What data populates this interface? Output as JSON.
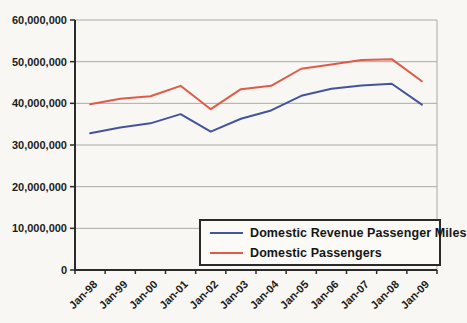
{
  "chart_data": {
    "type": "line",
    "title": "",
    "xlabel": "",
    "ylabel": "",
    "categories": [
      "Jan-98",
      "Jan-99",
      "Jan-00",
      "Jan-01",
      "Jan-02",
      "Jan-03",
      "Jan-04",
      "Jan-05",
      "Jan-06",
      "Jan-07",
      "Jan-08",
      "Jan-09"
    ],
    "series": [
      {
        "name": "Domestic Revenue Passenger Miles",
        "color": "#44549c",
        "values": [
          32800000,
          34200000,
          35200000,
          37400000,
          33200000,
          36300000,
          38300000,
          41800000,
          43500000,
          44300000,
          44700000,
          39700000
        ]
      },
      {
        "name": "Domestic Passengers",
        "color": "#e05a48",
        "values": [
          39800000,
          41100000,
          41700000,
          44200000,
          38600000,
          43400000,
          44200000,
          48300000,
          49300000,
          50400000,
          50600000,
          45300000
        ]
      }
    ],
    "ylim": [
      0,
      60000000
    ],
    "y_tick_step": 10000000,
    "y_tick_labels": [
      "0",
      "10,000,000",
      "20,000,000",
      "30,000,000",
      "40,000,000",
      "50,000,000",
      "60,000,000"
    ],
    "grid": "horizontal",
    "legend_position": "inside-bottom-right",
    "colors": {
      "axis": "#2b2b2b",
      "gridline": "#a8aaa4",
      "text": "#1c1c1c",
      "background": "#f8f7f3"
    }
  }
}
